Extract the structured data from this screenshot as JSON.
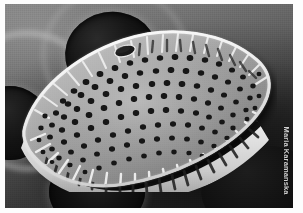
{
  "image": {
    "kind": "scanning-electron-micrograph",
    "subject": "diatom valve",
    "orientation": "landscape",
    "color_mode": "grayscale",
    "frame_color": "#fdfdfd",
    "background_color": "#3f3f3f"
  },
  "credit": {
    "text": "Maria Karamanska",
    "position": "right-edge-vertical",
    "color": "#cfcfcf"
  },
  "subject": {
    "name": "diatom-valve",
    "shape": "lanceolate-elliptic",
    "features": {
      "stigma_label": "stigma",
      "striae_label": "striae",
      "areolae_label": "areolae",
      "mantle_label": "valve-mantle",
      "sternum_label": "axial-area"
    },
    "stria_rows": 44,
    "areolae_visible": 310,
    "highlight_color": "#f2f2f2",
    "shadow_color": "#1a1a1a",
    "pore_color": "#121212"
  },
  "background": {
    "elements": [
      {
        "name": "substrate-pore-upper-left",
        "tone": "#111111"
      },
      {
        "name": "substrate-pore-left",
        "tone": "#101010"
      },
      {
        "name": "substrate-pore-lower",
        "tone": "#0d0d0d"
      },
      {
        "name": "substrate-shadow-right",
        "tone": "#0b0b0b"
      },
      {
        "name": "substrate-ridge",
        "tone": "#cdcdcd"
      }
    ]
  }
}
